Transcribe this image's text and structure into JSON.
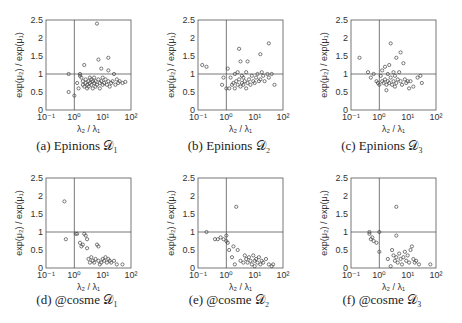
{
  "figure": {
    "panels": [
      {
        "id": "a",
        "caption": "(a) Epinions 𝒟₁"
      },
      {
        "id": "b",
        "caption": "(b) Epinions 𝒟₂"
      },
      {
        "id": "c",
        "caption": "(c) Epinions 𝒟₃"
      },
      {
        "id": "d",
        "caption": "(d) @cosme 𝒟₁"
      },
      {
        "id": "e",
        "caption": "(e) @cosme 𝒟₂"
      },
      {
        "id": "f",
        "caption": "(f) @cosme 𝒟₃"
      }
    ],
    "xlabel": "λ₂ / λ₁",
    "ylabel": "exp(μ₂) / exp(μ₁)",
    "xticks": [
      "10⁻¹",
      "10⁰",
      "10¹",
      "10²"
    ],
    "yticks": [
      "0",
      "0.5",
      "1",
      "1.5",
      "2",
      "2.5"
    ]
  },
  "chart_data": [
    {
      "type": "scatter",
      "title": "(a) Epinions D1",
      "xlabel": "λ2 / λ1",
      "ylabel": "exp(μ2) / exp(μ1)",
      "xscale": "log",
      "xlim": [
        0.1,
        100
      ],
      "ylim": [
        0,
        2.5
      ],
      "reference_lines": {
        "x": 1,
        "y": 1
      },
      "points_log10x_y": [
        [
          -0.2,
          1.0
        ],
        [
          -0.2,
          0.5
        ],
        [
          0.0,
          0.4
        ],
        [
          0.1,
          0.75
        ],
        [
          0.15,
          0.6
        ],
        [
          0.2,
          1.0
        ],
        [
          0.2,
          0.95
        ],
        [
          0.25,
          0.9
        ],
        [
          0.3,
          0.7
        ],
        [
          0.3,
          0.8
        ],
        [
          0.35,
          1.25
        ],
        [
          0.35,
          0.65
        ],
        [
          0.4,
          0.75
        ],
        [
          0.4,
          0.85
        ],
        [
          0.45,
          0.7
        ],
        [
          0.45,
          0.6
        ],
        [
          0.5,
          0.8
        ],
        [
          0.5,
          0.65
        ],
        [
          0.55,
          0.75
        ],
        [
          0.55,
          0.9
        ],
        [
          0.6,
          0.7
        ],
        [
          0.6,
          0.85
        ],
        [
          0.65,
          0.6
        ],
        [
          0.65,
          0.8
        ],
        [
          0.7,
          0.75
        ],
        [
          0.7,
          0.9
        ],
        [
          0.75,
          0.65
        ],
        [
          0.75,
          0.8
        ],
        [
          0.8,
          2.4
        ],
        [
          0.8,
          0.7
        ],
        [
          0.85,
          0.85
        ],
        [
          0.85,
          1.4
        ],
        [
          0.9,
          0.75
        ],
        [
          0.9,
          0.6
        ],
        [
          0.95,
          1.15
        ],
        [
          0.95,
          0.8
        ],
        [
          1.0,
          0.7
        ],
        [
          1.0,
          0.9
        ],
        [
          1.05,
          0.75
        ],
        [
          1.1,
          0.85
        ],
        [
          1.15,
          0.7
        ],
        [
          1.2,
          1.45
        ],
        [
          1.2,
          1.1
        ],
        [
          1.2,
          0.8
        ],
        [
          1.25,
          0.65
        ],
        [
          1.3,
          0.75
        ],
        [
          1.35,
          0.8
        ],
        [
          1.4,
          1.0
        ],
        [
          1.45,
          0.7
        ],
        [
          1.5,
          0.85
        ],
        [
          1.55,
          0.75
        ],
        [
          1.6,
          0.8
        ],
        [
          1.7,
          0.75
        ],
        [
          1.8,
          0.78
        ]
      ]
    },
    {
      "type": "scatter",
      "title": "(b) Epinions D2",
      "xlabel": "λ2 / λ1",
      "ylabel": "exp(μ2) / exp(μ1)",
      "xscale": "log",
      "xlim": [
        0.1,
        100
      ],
      "ylim": [
        0,
        2.5
      ],
      "reference_lines": {
        "x": 1,
        "y": 1
      },
      "points_log10x_y": [
        [
          -0.85,
          1.25
        ],
        [
          -0.7,
          1.2
        ],
        [
          -0.15,
          0.7
        ],
        [
          -0.1,
          0.9
        ],
        [
          0.0,
          0.6
        ],
        [
          0.05,
          1.15
        ],
        [
          0.1,
          0.6
        ],
        [
          0.15,
          0.9
        ],
        [
          0.2,
          0.7
        ],
        [
          0.25,
          0.75
        ],
        [
          0.3,
          1.0
        ],
        [
          0.3,
          0.6
        ],
        [
          0.35,
          0.8
        ],
        [
          0.4,
          0.7
        ],
        [
          0.4,
          1.05
        ],
        [
          0.45,
          0.85
        ],
        [
          0.45,
          1.7
        ],
        [
          0.5,
          0.65
        ],
        [
          0.5,
          1.35
        ],
        [
          0.55,
          0.75
        ],
        [
          0.55,
          0.95
        ],
        [
          0.6,
          0.9
        ],
        [
          0.6,
          0.7
        ],
        [
          0.65,
          0.8
        ],
        [
          0.7,
          1.05
        ],
        [
          0.7,
          0.6
        ],
        [
          0.75,
          1.35
        ],
        [
          0.75,
          0.75
        ],
        [
          0.8,
          0.85
        ],
        [
          0.85,
          0.7
        ],
        [
          0.9,
          0.95
        ],
        [
          0.95,
          0.8
        ],
        [
          1.0,
          0.75
        ],
        [
          1.05,
          0.9
        ],
        [
          1.1,
          1.0
        ],
        [
          1.15,
          0.8
        ],
        [
          1.2,
          1.55
        ],
        [
          1.2,
          0.85
        ],
        [
          1.25,
          1.05
        ],
        [
          1.3,
          0.95
        ],
        [
          1.35,
          0.8
        ],
        [
          1.45,
          1.0
        ],
        [
          1.5,
          1.85
        ],
        [
          1.5,
          0.9
        ],
        [
          1.6,
          1.0
        ],
        [
          1.7,
          0.7
        ]
      ]
    },
    {
      "type": "scatter",
      "title": "(c) Epinions D3",
      "xlabel": "λ2 / λ1",
      "ylabel": "exp(μ2) / exp(μ1)",
      "xscale": "log",
      "xlim": [
        0.1,
        100
      ],
      "ylim": [
        0,
        2.5
      ],
      "reference_lines": {
        "x": 1,
        "y": 1
      },
      "points_log10x_y": [
        [
          -0.7,
          1.45
        ],
        [
          -0.4,
          1.05
        ],
        [
          -0.3,
          0.9
        ],
        [
          -0.2,
          1.0
        ],
        [
          -0.1,
          0.8
        ],
        [
          -0.05,
          0.75
        ],
        [
          0.0,
          0.7
        ],
        [
          0.05,
          0.95
        ],
        [
          0.1,
          1.1
        ],
        [
          0.1,
          0.8
        ],
        [
          0.15,
          0.75
        ],
        [
          0.2,
          1.2
        ],
        [
          0.2,
          0.85
        ],
        [
          0.25,
          0.55
        ],
        [
          0.25,
          0.7
        ],
        [
          0.3,
          1.0
        ],
        [
          0.3,
          0.8
        ],
        [
          0.35,
          1.25
        ],
        [
          0.35,
          0.75
        ],
        [
          0.4,
          0.9
        ],
        [
          0.4,
          1.85
        ],
        [
          0.45,
          0.7
        ],
        [
          0.5,
          1.05
        ],
        [
          0.5,
          0.8
        ],
        [
          0.55,
          0.65
        ],
        [
          0.55,
          0.95
        ],
        [
          0.6,
          1.45
        ],
        [
          0.6,
          0.75
        ],
        [
          0.65,
          0.85
        ],
        [
          0.7,
          1.05
        ],
        [
          0.75,
          0.8
        ],
        [
          0.75,
          1.6
        ],
        [
          0.8,
          0.7
        ],
        [
          0.85,
          1.3
        ],
        [
          0.9,
          0.85
        ],
        [
          0.95,
          0.75
        ],
        [
          1.0,
          0.8
        ],
        [
          1.05,
          0.6
        ],
        [
          1.1,
          0.8
        ],
        [
          1.2,
          0.65
        ],
        [
          1.35,
          0.9
        ],
        [
          1.45,
          0.95
        ],
        [
          1.5,
          0.75
        ]
      ]
    },
    {
      "type": "scatter",
      "title": "(d) @cosme D1",
      "xlabel": "λ2 / λ1",
      "ylabel": "exp(μ2) / exp(μ1)",
      "xscale": "log",
      "xlim": [
        0.1,
        100
      ],
      "ylim": [
        0,
        2.5
      ],
      "reference_lines": {
        "x": 1,
        "y": 1
      },
      "points_log10x_y": [
        [
          -0.35,
          1.85
        ],
        [
          -0.3,
          0.8
        ],
        [
          0.05,
          0.95
        ],
        [
          0.1,
          0.95
        ],
        [
          0.2,
          0.7
        ],
        [
          0.25,
          0.6
        ],
        [
          0.3,
          0.65
        ],
        [
          0.35,
          0.95
        ],
        [
          0.4,
          0.9
        ],
        [
          0.45,
          0.8
        ],
        [
          0.45,
          0.55
        ],
        [
          0.5,
          0.25
        ],
        [
          0.55,
          0.15
        ],
        [
          0.6,
          0.3
        ],
        [
          0.65,
          0.2
        ],
        [
          0.7,
          0.15
        ],
        [
          0.75,
          0.25
        ],
        [
          0.8,
          0.65
        ],
        [
          0.85,
          0.6
        ],
        [
          0.85,
          0.2
        ],
        [
          0.9,
          0.1
        ],
        [
          0.95,
          0.15
        ],
        [
          1.0,
          0.25
        ],
        [
          1.05,
          0.2
        ],
        [
          1.1,
          0.3
        ],
        [
          1.15,
          0.15
        ],
        [
          1.2,
          0.25
        ],
        [
          1.25,
          0.2
        ],
        [
          1.3,
          0.15
        ],
        [
          1.4,
          0.2
        ],
        [
          1.5,
          0.1
        ],
        [
          1.7,
          0.1
        ]
      ]
    },
    {
      "type": "scatter",
      "title": "(e) @cosme D2",
      "xlabel": "λ2 / λ1",
      "ylabel": "exp(μ2) / exp(μ1)",
      "xscale": "log",
      "xlim": [
        0.1,
        100
      ],
      "ylim": [
        0,
        2.5
      ],
      "reference_lines": {
        "x": 1,
        "y": 1
      },
      "points_log10x_y": [
        [
          -0.7,
          1.0
        ],
        [
          -0.4,
          0.8
        ],
        [
          -0.3,
          0.8
        ],
        [
          -0.2,
          0.85
        ],
        [
          -0.1,
          0.8
        ],
        [
          0.0,
          0.9
        ],
        [
          0.0,
          0.75
        ],
        [
          0.05,
          0.7
        ],
        [
          0.1,
          0.5
        ],
        [
          0.2,
          0.3
        ],
        [
          0.25,
          0.6
        ],
        [
          0.3,
          0.1
        ],
        [
          0.35,
          1.7
        ],
        [
          0.4,
          0.5
        ],
        [
          0.5,
          0.2
        ],
        [
          0.6,
          0.15
        ],
        [
          0.65,
          0.35
        ],
        [
          0.7,
          0.25
        ],
        [
          0.75,
          0.15
        ],
        [
          0.8,
          0.3
        ],
        [
          0.85,
          0.2
        ],
        [
          0.9,
          0.1
        ],
        [
          0.95,
          0.35
        ],
        [
          1.0,
          0.2
        ],
        [
          1.0,
          0.05
        ],
        [
          1.05,
          0.25
        ],
        [
          1.1,
          0.15
        ],
        [
          1.15,
          0.3
        ],
        [
          1.2,
          0.1
        ],
        [
          1.25,
          0.2
        ],
        [
          1.3,
          0.15
        ],
        [
          1.4,
          0.25
        ],
        [
          1.5,
          0.1
        ],
        [
          1.6,
          0.05
        ],
        [
          1.65,
          0.1
        ]
      ]
    },
    {
      "type": "scatter",
      "title": "(f) @cosme D3",
      "xlabel": "λ2 / λ1",
      "ylabel": "exp(μ2) / exp(μ1)",
      "xscale": "log",
      "xlim": [
        0.1,
        100
      ],
      "ylim": [
        0,
        2.5
      ],
      "reference_lines": {
        "x": 1,
        "y": 1
      },
      "points_log10x_y": [
        [
          -0.35,
          1.0
        ],
        [
          -0.35,
          0.95
        ],
        [
          -0.3,
          0.8
        ],
        [
          -0.25,
          0.85
        ],
        [
          -0.2,
          0.75
        ],
        [
          -0.1,
          0.7
        ],
        [
          0.0,
          1.0
        ],
        [
          0.0,
          0.45
        ],
        [
          0.3,
          0.25
        ],
        [
          0.4,
          0.05
        ],
        [
          0.45,
          0.5
        ],
        [
          0.5,
          0.35
        ],
        [
          0.55,
          0.2
        ],
        [
          0.6,
          0.3
        ],
        [
          0.6,
          1.7
        ],
        [
          0.6,
          0.9
        ],
        [
          0.65,
          0.15
        ],
        [
          0.7,
          0.4
        ],
        [
          0.75,
          0.25
        ],
        [
          0.8,
          0.1
        ],
        [
          0.85,
          0.3
        ],
        [
          0.9,
          0.45
        ],
        [
          0.95,
          0.2
        ],
        [
          1.0,
          0.35
        ],
        [
          1.05,
          0.15
        ],
        [
          1.1,
          0.5
        ],
        [
          1.15,
          0.6
        ],
        [
          1.2,
          0.25
        ],
        [
          1.25,
          0.15
        ],
        [
          1.3,
          0.2
        ],
        [
          1.4,
          0.1
        ],
        [
          1.8,
          0.1
        ]
      ]
    }
  ]
}
